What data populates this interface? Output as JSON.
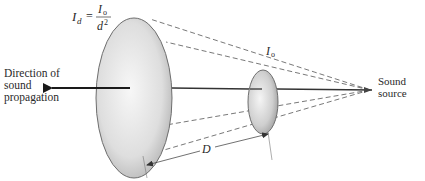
{
  "diagram": {
    "formula": {
      "lhs": "I",
      "lhs_sub": "d",
      "equals": "=",
      "numerator": "I",
      "numerator_sub": "o",
      "denominator": "d",
      "denominator_sup": "2"
    },
    "labels": {
      "direction_line1": "Direction of",
      "direction_line2": "sound",
      "direction_line3": "propagation",
      "source_line1": "Sound",
      "source_line2": "source",
      "near_intensity": "I",
      "near_intensity_sub": "o",
      "distance": "D"
    },
    "colors": {
      "line": "#333333",
      "dashed": "#555555",
      "ellipse_fill_center": "#f4f4f4",
      "ellipse_fill_edge": "#bdbdbd",
      "ellipse_stroke": "#6e6e6e",
      "text": "#2a2a2a"
    }
  }
}
